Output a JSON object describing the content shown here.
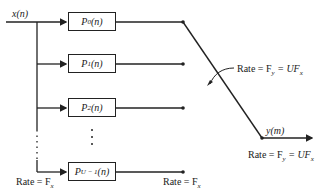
{
  "diagram": {
    "input_label": "x(n)",
    "output_label": "y(m)",
    "filters": [
      {
        "label": "P",
        "sub": "0",
        "arg": "(n)"
      },
      {
        "label": "P",
        "sub": "1",
        "arg": "(n)"
      },
      {
        "label": "P",
        "sub": "2",
        "arg": "(n)"
      },
      {
        "label": "P",
        "sub": "U − 1",
        "arg": "(n)"
      }
    ],
    "rates": {
      "input_rate": "Rate = F",
      "input_rate_sub": "x",
      "branch_rate": "Rate = F",
      "branch_rate_sub": "x",
      "commutator_rate": "Rate = F",
      "commutator_rate_sub": "y",
      "commutator_rate_eq": " = UF",
      "commutator_rate_eq_sub": "x",
      "output_rate": "Rate = F",
      "output_rate_sub": "y",
      "output_rate_eq": " =  UF",
      "output_rate_eq_sub": "x"
    },
    "colors": {
      "line": "#222222",
      "background": "#ffffff"
    }
  }
}
